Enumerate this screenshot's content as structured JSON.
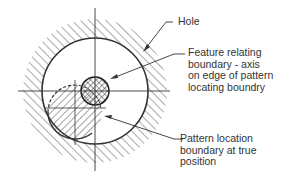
{
  "labels": {
    "hole": "Hole",
    "feature_line1": "Feature relating",
    "feature_line2": "boundary - axis",
    "feature_line3": "on edge of pattern",
    "feature_line4": "locating boundry",
    "pattern_line1": "Pattern location",
    "pattern_line2": "boundary at true",
    "pattern_line3": "position"
  },
  "colors": {
    "stroke": "#333333",
    "text": "#333333",
    "background": "#ffffff"
  }
}
